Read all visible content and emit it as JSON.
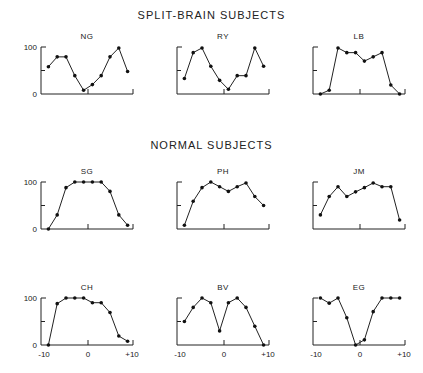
{
  "titles": {
    "split_brain": "SPLIT-BRAIN SUBJECTS",
    "normal": "NORMAL SUBJECTS"
  },
  "axis_labels": {
    "y_top": "100",
    "y_bottom": "0",
    "x_left": "-10",
    "x_mid": "0",
    "x_right": "+10"
  },
  "chart_data": [
    {
      "type": "line",
      "title": "NG",
      "group": "SPLIT-BRAIN SUBJECTS",
      "x": [
        -9,
        -7,
        -5,
        -3,
        -1,
        1,
        3,
        5,
        7,
        9
      ],
      "values": [
        58,
        79,
        79,
        39,
        8,
        20,
        39,
        79,
        98,
        48
      ],
      "xlim": [
        -10,
        10
      ],
      "ylim": [
        0,
        100
      ],
      "yticks": [
        0,
        50,
        100
      ],
      "grid": false
    },
    {
      "type": "line",
      "title": "RY",
      "group": "SPLIT-BRAIN SUBJECTS",
      "x": [
        -9,
        -7,
        -5,
        -3,
        -1,
        1,
        3,
        5,
        7,
        9
      ],
      "values": [
        33,
        88,
        98,
        59,
        29,
        10,
        39,
        39,
        98,
        59
      ],
      "xlim": [
        -10,
        10
      ],
      "ylim": [
        0,
        100
      ],
      "yticks": [
        0,
        50,
        100
      ],
      "grid": false
    },
    {
      "type": "line",
      "title": "LB",
      "group": "SPLIT-BRAIN SUBJECTS",
      "x": [
        -9,
        -7,
        -5,
        -3,
        -1,
        1,
        3,
        5,
        7,
        9
      ],
      "values": [
        0,
        8,
        98,
        88,
        88,
        70,
        79,
        88,
        19,
        0
      ],
      "xlim": [
        -10,
        10
      ],
      "ylim": [
        0,
        100
      ],
      "yticks": [
        0,
        50,
        100
      ],
      "grid": false
    },
    {
      "type": "line",
      "title": "SG",
      "group": "NORMAL SUBJECTS",
      "x": [
        -9,
        -7,
        -5,
        -3,
        -1,
        1,
        3,
        5,
        7,
        9
      ],
      "values": [
        0,
        30,
        88,
        100,
        100,
        100,
        100,
        80,
        30,
        8
      ],
      "xlim": [
        -10,
        10
      ],
      "ylim": [
        0,
        100
      ],
      "yticks": [
        0,
        50,
        100
      ],
      "grid": false
    },
    {
      "type": "line",
      "title": "PH",
      "group": "NORMAL SUBJECTS",
      "x": [
        -9,
        -7,
        -5,
        -3,
        -1,
        1,
        3,
        5,
        7,
        9
      ],
      "values": [
        8,
        59,
        88,
        100,
        90,
        80,
        90,
        98,
        69,
        50
      ],
      "xlim": [
        -10,
        10
      ],
      "ylim": [
        0,
        100
      ],
      "yticks": [
        0,
        50,
        100
      ],
      "grid": false
    },
    {
      "type": "line",
      "title": "JM",
      "group": "NORMAL SUBJECTS",
      "x": [
        -9,
        -7,
        -5,
        -3,
        -1,
        1,
        3,
        5,
        7,
        9
      ],
      "values": [
        30,
        69,
        90,
        69,
        79,
        88,
        98,
        90,
        90,
        19
      ],
      "xlim": [
        -10,
        10
      ],
      "ylim": [
        0,
        100
      ],
      "yticks": [
        0,
        50,
        100
      ],
      "grid": false
    },
    {
      "type": "line",
      "title": "CH",
      "group": "NORMAL SUBJECTS",
      "x": [
        -9,
        -7,
        -5,
        -3,
        -1,
        1,
        3,
        5,
        7,
        9
      ],
      "values": [
        0,
        88,
        100,
        100,
        100,
        90,
        90,
        69,
        19,
        8
      ],
      "xlim": [
        -10,
        10
      ],
      "ylim": [
        0,
        100
      ],
      "yticks": [
        0,
        50,
        100
      ],
      "grid": false
    },
    {
      "type": "line",
      "title": "BV",
      "group": "NORMAL SUBJECTS",
      "x": [
        -9,
        -7,
        -5,
        -3,
        -1,
        1,
        3,
        5,
        7,
        9
      ],
      "values": [
        50,
        80,
        100,
        90,
        30,
        90,
        100,
        80,
        40,
        0
      ],
      "xlim": [
        -10,
        10
      ],
      "ylim": [
        0,
        100
      ],
      "yticks": [
        0,
        50,
        100
      ],
      "grid": false
    },
    {
      "type": "line",
      "title": "EG",
      "group": "NORMAL SUBJECTS",
      "x": [
        -9,
        -7,
        -5,
        -3,
        -1,
        1,
        3,
        5,
        7,
        9
      ],
      "values": [
        100,
        89,
        100,
        58,
        0,
        11,
        71,
        100,
        100,
        100
      ],
      "xlim": [
        -10,
        10
      ],
      "ylim": [
        0,
        100
      ],
      "yticks": [
        0,
        50,
        100
      ],
      "grid": false
    }
  ],
  "layout": {
    "columns_left": [
      41,
      177,
      313
    ],
    "panel_width": 92,
    "rows": [
      {
        "top": 47,
        "bottom": 94,
        "y_labels": true,
        "x_labels": false,
        "charts": [
          0,
          1,
          2
        ]
      },
      {
        "top": 182,
        "bottom": 229,
        "y_labels": true,
        "x_labels": false,
        "charts": [
          3,
          4,
          5
        ]
      },
      {
        "top": 298,
        "bottom": 345,
        "y_labels": true,
        "x_labels": true,
        "charts": [
          6,
          7,
          8
        ]
      }
    ],
    "ink_color": "#222222"
  }
}
